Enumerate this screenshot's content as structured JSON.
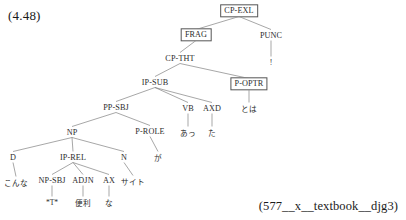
{
  "example_number": "(4.48)",
  "caption": "(577__x__textbook__djg3)",
  "tree": {
    "nodes": [
      {
        "id": "cp-exl",
        "label": "CP-EXL",
        "x": 239,
        "y": 11,
        "boxed": true
      },
      {
        "id": "frag",
        "label": "FRAG",
        "x": 196,
        "y": 35,
        "boxed": true
      },
      {
        "id": "punc",
        "label": "PUNC",
        "x": 271,
        "y": 35,
        "boxed": false
      },
      {
        "id": "cp-tht",
        "label": "CP-THT",
        "x": 180,
        "y": 58,
        "boxed": false
      },
      {
        "id": "ip-sub",
        "label": "IP-SUB",
        "x": 155,
        "y": 82,
        "boxed": false
      },
      {
        "id": "p-optr",
        "label": "P-OPTR",
        "x": 249,
        "y": 84,
        "boxed": true
      },
      {
        "id": "pp-sbj",
        "label": "PP-SBJ",
        "x": 116,
        "y": 107,
        "boxed": false
      },
      {
        "id": "vb",
        "label": "VB",
        "x": 188,
        "y": 108,
        "boxed": false
      },
      {
        "id": "axd",
        "label": "AXD",
        "x": 212,
        "y": 108,
        "boxed": false
      },
      {
        "id": "np",
        "label": "NP",
        "x": 72,
        "y": 132,
        "boxed": false
      },
      {
        "id": "p-role",
        "label": "P-ROLE",
        "x": 150,
        "y": 131,
        "boxed": false
      },
      {
        "id": "d",
        "label": "D",
        "x": 13,
        "y": 157,
        "boxed": false
      },
      {
        "id": "ip-rel",
        "label": "IP-REL",
        "x": 73,
        "y": 157,
        "boxed": false
      },
      {
        "id": "n",
        "label": "N",
        "x": 124,
        "y": 157,
        "boxed": false
      },
      {
        "id": "np-sbj",
        "label": "NP-SBJ",
        "x": 52,
        "y": 180,
        "boxed": false
      },
      {
        "id": "adjn",
        "label": "ADJN",
        "x": 83,
        "y": 180,
        "boxed": false
      },
      {
        "id": "ax",
        "label": "AX",
        "x": 109,
        "y": 180,
        "boxed": false
      }
    ],
    "leaves": [
      {
        "id": "leaf-punc",
        "label": "!",
        "x": 271,
        "y": 62,
        "script": "latin"
      },
      {
        "id": "leaf-p-optr",
        "label": "とは",
        "x": 249,
        "y": 108,
        "script": "jp"
      },
      {
        "id": "leaf-vb",
        "label": "あっ",
        "x": 188,
        "y": 132,
        "script": "jp"
      },
      {
        "id": "leaf-axd",
        "label": "た",
        "x": 212,
        "y": 132,
        "script": "jp"
      },
      {
        "id": "leaf-p-role",
        "label": "が",
        "x": 158,
        "y": 157,
        "script": "jp"
      },
      {
        "id": "leaf-d",
        "label": "こんな",
        "x": 16,
        "y": 182,
        "script": "jp"
      },
      {
        "id": "leaf-n",
        "label": "サイト",
        "x": 133,
        "y": 181,
        "script": "jp"
      },
      {
        "id": "leaf-np-sbj",
        "label": "*T*",
        "x": 52,
        "y": 202,
        "script": "latin"
      },
      {
        "id": "leaf-adjn",
        "label": "便利",
        "x": 83,
        "y": 202,
        "script": "jp"
      },
      {
        "id": "leaf-ax",
        "label": "な",
        "x": 109,
        "y": 202,
        "script": "jp"
      }
    ],
    "edges": [
      {
        "from": "cp-exl",
        "to": "frag"
      },
      {
        "from": "cp-exl",
        "to": "punc"
      },
      {
        "from": "frag",
        "to": "cp-tht"
      },
      {
        "from": "punc",
        "to": "leaf-punc"
      },
      {
        "from": "cp-tht",
        "to": "ip-sub"
      },
      {
        "from": "cp-tht",
        "to": "p-optr"
      },
      {
        "from": "p-optr",
        "to": "leaf-p-optr"
      },
      {
        "from": "ip-sub",
        "to": "pp-sbj"
      },
      {
        "from": "ip-sub",
        "to": "vb"
      },
      {
        "from": "ip-sub",
        "to": "axd"
      },
      {
        "from": "vb",
        "to": "leaf-vb"
      },
      {
        "from": "axd",
        "to": "leaf-axd"
      },
      {
        "from": "pp-sbj",
        "to": "np"
      },
      {
        "from": "pp-sbj",
        "to": "p-role"
      },
      {
        "from": "p-role",
        "to": "leaf-p-role"
      },
      {
        "from": "np",
        "to": "d"
      },
      {
        "from": "np",
        "to": "ip-rel"
      },
      {
        "from": "np",
        "to": "n"
      },
      {
        "from": "d",
        "to": "leaf-d"
      },
      {
        "from": "n",
        "to": "leaf-n"
      },
      {
        "from": "ip-rel",
        "to": "np-sbj"
      },
      {
        "from": "ip-rel",
        "to": "adjn"
      },
      {
        "from": "ip-rel",
        "to": "ax"
      },
      {
        "from": "np-sbj",
        "to": "leaf-np-sbj"
      },
      {
        "from": "adjn",
        "to": "leaf-adjn"
      },
      {
        "from": "ax",
        "to": "leaf-ax"
      }
    ]
  }
}
